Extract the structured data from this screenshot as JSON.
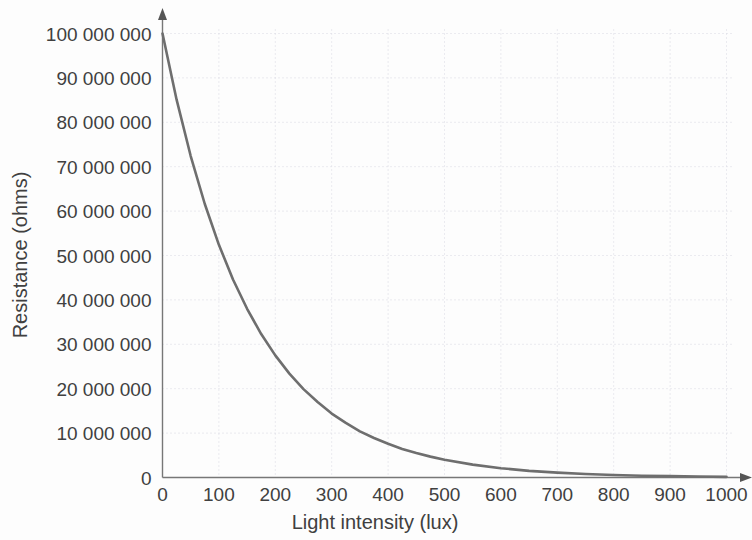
{
  "chart_data": {
    "type": "line",
    "title": "",
    "subtitle": "",
    "xlabel": "Light intensity (lux)",
    "ylabel": "Resistance (ohms)",
    "xlim": [
      0,
      1000
    ],
    "ylim": [
      0,
      100000000
    ],
    "grid": true,
    "legend": null,
    "legend_position": "none",
    "curve_color": "#6e6e6e",
    "grid_color": "#d8d8e2",
    "axis_color": "#777777",
    "text_color": "#404040",
    "background_color": "#fdfdfd",
    "x_ticks": [
      0,
      100,
      200,
      300,
      400,
      500,
      600,
      700,
      800,
      900,
      1000
    ],
    "x_tick_labels": [
      "0",
      "100",
      "200",
      "300",
      "400",
      "500",
      "600",
      "700",
      "800",
      "900",
      "1000"
    ],
    "y_ticks": [
      0,
      10000000,
      20000000,
      30000000,
      40000000,
      50000000,
      60000000,
      70000000,
      80000000,
      90000000,
      100000000
    ],
    "y_tick_labels": [
      "0",
      "10 000 000",
      "20 000 000",
      "30 000 000",
      "40 000 000",
      "50 000 000",
      "60 000 000",
      "70 000 000",
      "80 000 000",
      "90 000 000",
      "100 000 000"
    ],
    "series": [
      {
        "name": "Resistance vs light intensity",
        "x": [
          0,
          25,
          50,
          75,
          100,
          125,
          150,
          175,
          200,
          225,
          250,
          275,
          300,
          325,
          350,
          375,
          400,
          425,
          450,
          475,
          500,
          550,
          600,
          650,
          700,
          750,
          800,
          850,
          900,
          950,
          1000
        ],
        "values": [
          100000000,
          85100000,
          72400000,
          61600000,
          52400000,
          44600000,
          38000000,
          32300000,
          27500000,
          23400000,
          19900000,
          17000000,
          14400000,
          12300000,
          10400000,
          8900000,
          7600000,
          6400000,
          5500000,
          4700000,
          4000000,
          2900000,
          2100000,
          1500000,
          1100000,
          800000,
          570000,
          410000,
          300000,
          210000,
          150000
        ]
      }
    ]
  },
  "axes": {
    "x_title": "Light intensity (lux)",
    "y_title": "Resistance (ohms)"
  }
}
